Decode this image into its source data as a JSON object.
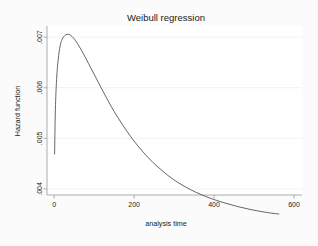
{
  "chart_data": {
    "type": "line",
    "title": "Weibull regression",
    "xlabel": "analysis time",
    "ylabel": "Hazard function",
    "xlim": [
      -18,
      620
    ],
    "ylim": [
      0.00388,
      0.00722
    ],
    "xticks": [
      0,
      200,
      400,
      600
    ],
    "xtick_labels": [
      "0",
      "200",
      "400",
      "600"
    ],
    "yticks": [
      0.004,
      0.005,
      0.006,
      0.007
    ],
    "ytick_labels": [
      ".004",
      ".005",
      ".006",
      ".007"
    ],
    "grid": "horizontal",
    "legend": "none",
    "series": [
      {
        "name": "hazard",
        "color": "#55555a",
        "x": [
          1,
          3,
          6,
          10,
          15,
          20,
          26,
          32,
          38,
          45,
          52,
          60,
          70,
          80,
          92,
          105,
          120,
          135,
          150,
          170,
          190,
          210,
          235,
          260,
          285,
          310,
          340,
          370,
          400,
          430,
          460,
          490,
          520,
          545,
          562
        ],
        "y": [
          0.00469,
          0.00558,
          0.00616,
          0.00656,
          0.00683,
          0.00696,
          0.00703,
          0.007055,
          0.00705,
          0.00701,
          0.006945,
          0.00685,
          0.006715,
          0.00657,
          0.006385,
          0.00619,
          0.00596,
          0.00574,
          0.00553,
          0.00528,
          0.00505,
          0.004845,
          0.00462,
          0.00443,
          0.004265,
          0.004125,
          0.00399,
          0.00388,
          0.00379,
          0.003715,
          0.00365,
          0.003595,
          0.00355,
          0.00352,
          0.003505
        ]
      }
    ],
    "peak": {
      "x": 34,
      "y": 0.00706
    },
    "curve_start": {
      "x": 1,
      "y": 0.00469
    },
    "curve_end": {
      "x": 562,
      "y": 0.0035
    }
  },
  "colors": {
    "background": "#fbfbfb",
    "plot_background": "#ffffff",
    "curve": "#55555a",
    "axis": "#9a9a9c",
    "gridline": "#ececed",
    "text": "#1a1a1a"
  }
}
